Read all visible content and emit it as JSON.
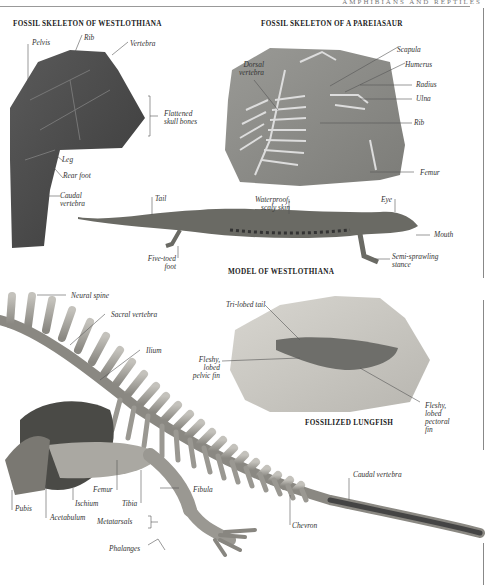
{
  "page": {
    "running_header": "AMPHIBIANS AND REPTILES"
  },
  "westlothiana_fossil": {
    "title": "FOSSIL SKELETON OF WESTLOTHIANA",
    "labels": {
      "pelvis": "Pelvis",
      "rib": "Rib",
      "vertebra": "Vertebra",
      "flattened_skull_1": "Flattened",
      "flattened_skull_2": "skull bones",
      "leg": "Leg",
      "rear_foot": "Rear foot",
      "caudal_1": "Caudal",
      "caudal_2": "vertebra"
    }
  },
  "pareiasaur_fossil": {
    "title": "FOSSIL SKELETON OF A PAREIASAUR",
    "labels": {
      "dorsal_1": "Dorsal",
      "dorsal_2": "vertebra",
      "scapula": "Scapula",
      "humerus": "Humerus",
      "radius": "Radius",
      "ulna": "Ulna",
      "rib": "Rib",
      "femur": "Femur"
    }
  },
  "westlothiana_model": {
    "title": "MODEL OF WESTLOTHIANA",
    "labels": {
      "tail": "Tail",
      "skin_1": "Waterproof,",
      "skin_2": "scaly skin",
      "eye": "Eye",
      "mouth": "Mouth",
      "five_toed_1": "Five-toed",
      "five_toed_2": "foot",
      "stance_1": "Semi-sprawling",
      "stance_2": "stance"
    }
  },
  "lungfish": {
    "title": "FOSSILIZED LUNGFISH",
    "labels": {
      "tail": "Tri-lobed tail",
      "pelvic_1": "Fleshy,",
      "pelvic_2": "lobed",
      "pelvic_3": "pelvic fin",
      "pectoral_1": "Fleshy,",
      "pectoral_2": "lobed",
      "pectoral_3": "pectoral",
      "pectoral_4": "fin"
    }
  },
  "skeleton": {
    "labels": {
      "neural_spine": "Neural spine",
      "sacral_vertebra": "Sacral vertebra",
      "ilium": "Ilium",
      "caudal_vertebra": "Caudal vertebra",
      "femur": "Femur",
      "fibula": "Fibula",
      "tibia": "Tibia",
      "ischium": "Ischium",
      "pubis": "Pubis",
      "acetabulum": "Acetabulum",
      "metatarsals": "Metatarsals",
      "phalanges": "Phalanges",
      "chevron": "Chevron"
    }
  }
}
